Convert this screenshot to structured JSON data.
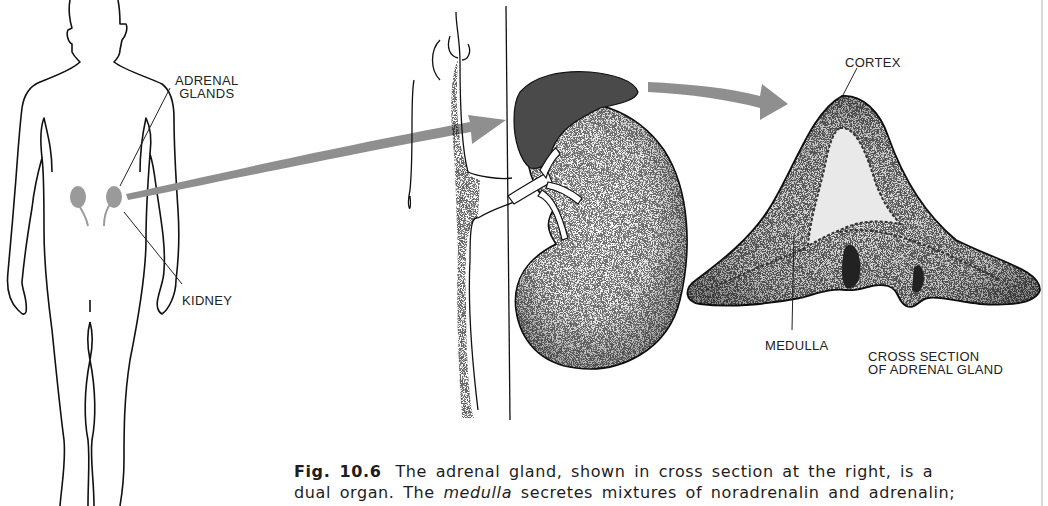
{
  "figure": {
    "number": "Fig. 10.6",
    "labels": {
      "adrenal_glands": [
        "ADRENAL",
        "GLANDS"
      ],
      "kidney": "KIDNEY",
      "cortex": "CORTEX",
      "medulla": "MEDULLA",
      "cross_section": [
        "CROSS SECTION",
        "OF ADRENAL GLAND"
      ]
    },
    "caption": {
      "line1_text": "The adrenal gland, shown in cross section at the right, is a",
      "line2_pre": "dual organ. The ",
      "line2_em": "medulla",
      "line2_post": " secretes mixtures of noradrenalin and adrenalin;"
    },
    "colors": {
      "arrow": "#8f8f8f",
      "outline": "#111111",
      "kidney_gray": "#9a9a9a",
      "adrenal_dark": "#4a4a4a"
    }
  }
}
